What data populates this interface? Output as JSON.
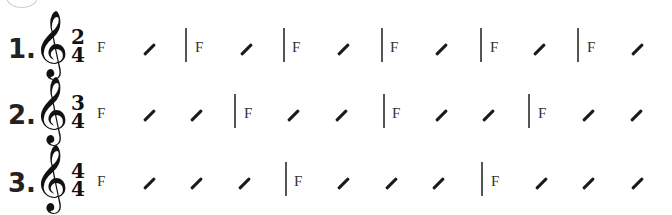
{
  "exercises": [
    {
      "number": "1.",
      "clef": "𝄞",
      "time_top": "2",
      "time_bottom": "4",
      "chord": "F",
      "y": 22,
      "chords_x": [
        97,
        195,
        292,
        390,
        490,
        587
      ],
      "slashes_x": [
        148,
        245,
        342,
        440,
        538,
        636
      ],
      "bars_x": [
        185,
        283,
        381,
        480,
        577
      ]
    },
    {
      "number": "2.",
      "clef": "𝄞",
      "time_top": "3",
      "time_bottom": "4",
      "chord": "F",
      "y": 88,
      "chords_x": [
        97,
        244,
        392,
        538
      ],
      "slashes_x": [
        148,
        195,
        292,
        340,
        440,
        487,
        587,
        635
      ],
      "bars_x": [
        234,
        383,
        528
      ]
    },
    {
      "number": "3.",
      "clef": "𝄞",
      "time_top": "4",
      "time_bottom": "4",
      "chord": "F",
      "y": 156,
      "chords_x": [
        97,
        294,
        491
      ],
      "slashes_x": [
        148,
        195,
        243,
        342,
        390,
        437,
        540,
        587,
        636
      ],
      "bars_x": [
        285,
        481
      ]
    }
  ]
}
